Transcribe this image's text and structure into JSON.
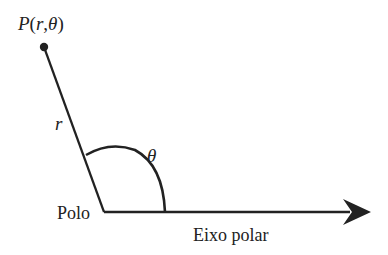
{
  "diagram": {
    "type": "polar-coordinate-system",
    "point_label": {
      "prefix": "P",
      "open": "(",
      "r": "r",
      "comma": ",",
      "theta": "θ",
      "close": ")"
    },
    "radius_label": "r",
    "angle_label": "θ",
    "pole_label": "Polo",
    "axis_label": "Eixo polar",
    "colors": {
      "stroke": "#222222",
      "background": "#ffffff"
    }
  }
}
